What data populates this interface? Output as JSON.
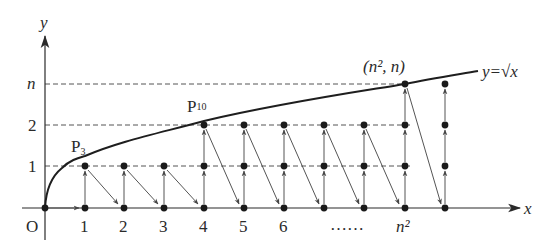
{
  "diagram": {
    "axes": {
      "x_label": "x",
      "y_label": "y",
      "origin_label": "O"
    },
    "curve_label": "y=√x",
    "x_ticks": [
      "1",
      "2",
      "3",
      "4",
      "5",
      "6",
      "……",
      "n²"
    ],
    "y_ticks": [
      "1",
      "2",
      "n"
    ],
    "points": {
      "p3": "P",
      "p3_sub": "3",
      "p10": "P",
      "p10_sub": "10",
      "top": "(n², n)"
    },
    "colors": {
      "stroke": "#2a2a2a",
      "dashed": "#555555",
      "arrow": "#555555",
      "dot": "#1a1a1a"
    }
  }
}
